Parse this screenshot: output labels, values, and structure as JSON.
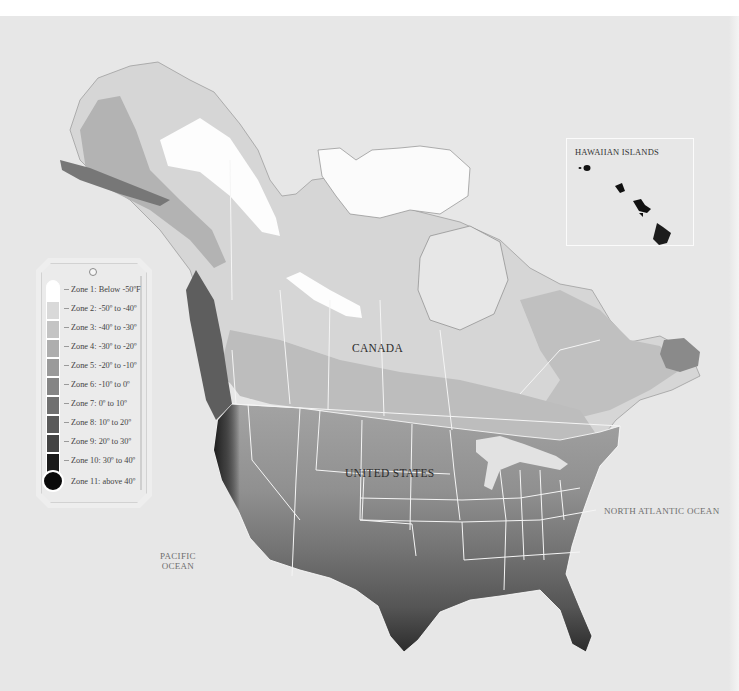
{
  "map": {
    "title": "Plant hardiness zones of North America",
    "background_color": "#e7e7e7",
    "border_color": "#ffffff"
  },
  "labels": {
    "canada": "CANADA",
    "united_states": "UNITED STATES",
    "pacific_ocean_line1": "PACIFIC",
    "pacific_ocean_line2": "OCEAN",
    "north_atlantic_ocean": "NORTH ATLANTIC OCEAN",
    "hawaiian_islands": "HAWAIIAN ISLANDS"
  },
  "legend": {
    "unit": "°F",
    "zones": [
      {
        "label": "Zone 1: Below -50ºF",
        "color": "#ffffff"
      },
      {
        "label": "Zone 2: -50º to -40º",
        "color": "#d9d9d9"
      },
      {
        "label": "Zone 3: -40º to -30º",
        "color": "#c4c4c4"
      },
      {
        "label": "Zone 4: -30º to -20º",
        "color": "#aeaeae"
      },
      {
        "label": "Zone 5: -20º to -10º",
        "color": "#9a9a9a"
      },
      {
        "label": "Zone 6: -10º to 0º",
        "color": "#858585"
      },
      {
        "label": "Zone 7: 0º to 10º",
        "color": "#707070"
      },
      {
        "label": "Zone 8: 10º to 20º",
        "color": "#5a5a5a"
      },
      {
        "label": "Zone 9: 20º to 30º",
        "color": "#444444"
      },
      {
        "label": "Zone 10: 30º to 40º",
        "color": "#2a2a2a"
      },
      {
        "label": "Zone 11: above 40º",
        "color": "#0b0b0b"
      }
    ]
  }
}
